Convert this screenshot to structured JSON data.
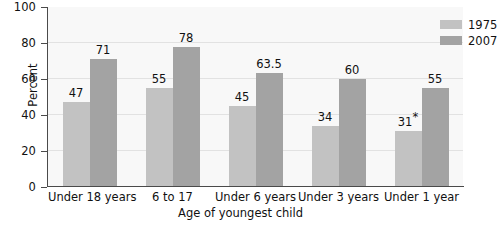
{
  "chart_data": {
    "type": "bar",
    "title": "",
    "xlabel": "Age of youngest child",
    "ylabel": "Percent",
    "ylim": [
      0,
      100
    ],
    "yticks": [
      0,
      20,
      40,
      60,
      80,
      100
    ],
    "ytick_labels": [
      "0",
      "20",
      "40",
      "60",
      "80",
      "100"
    ],
    "grid": true,
    "legend_position": "top-right",
    "categories": [
      "Under 18 years",
      "6 to 17",
      "Under 6 years",
      "Under 3 years",
      "Under 1 year"
    ],
    "series": [
      {
        "name": "1975",
        "color": "#c2c2c2",
        "values": [
          47,
          55,
          45,
          34,
          31
        ],
        "labels": [
          "47",
          "55",
          "45",
          "34",
          "31*"
        ]
      },
      {
        "name": "2007",
        "color": "#a3a3a3",
        "values": [
          71,
          78,
          63.5,
          60,
          55
        ],
        "labels": [
          "71",
          "78",
          "63.5",
          "60",
          "55"
        ]
      }
    ],
    "annotations": [
      "*"
    ]
  },
  "legend": {
    "items": [
      {
        "label": "1975",
        "swatch": "legend-swatch-1975"
      },
      {
        "label": "2007",
        "swatch": "legend-swatch-2007"
      }
    ]
  },
  "colors": {
    "series_1975": "#c2c2c2",
    "series_2007": "#a3a3a3",
    "plot_background": "#f8f8f8",
    "gridline": "#e2e2e2",
    "axis": "#4a4a4a",
    "text": "#111111"
  }
}
